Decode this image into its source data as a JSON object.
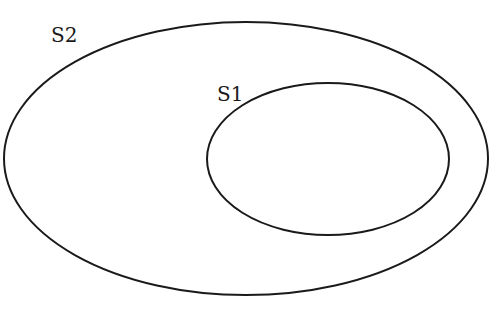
{
  "diagram": {
    "type": "venn-subset",
    "stroke_color": "#1a1a1a",
    "background": "#ffffff",
    "sets": [
      {
        "id": "S2",
        "label": "S2",
        "role": "outer",
        "ellipse": {
          "cx": 246,
          "cy": 158.5,
          "rx": 242,
          "ry": 136.5
        },
        "label_pos": {
          "x": 51,
          "y": 42
        }
      },
      {
        "id": "S1",
        "label": "S1",
        "role": "inner",
        "contained_in": "S2",
        "ellipse": {
          "cx": 328,
          "cy": 159,
          "rx": 121,
          "ry": 76
        },
        "label_pos": {
          "x": 217,
          "y": 101
        }
      }
    ]
  }
}
